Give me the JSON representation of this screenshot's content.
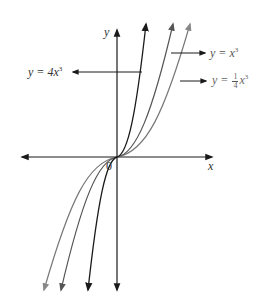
{
  "figure": {
    "axes": {
      "x_label": "x",
      "y_label": "y",
      "origin_label": "0"
    },
    "curves": [
      {
        "id": "y4x3",
        "equation": "y = 4x^3",
        "label_prefix": "y = 4",
        "label_var": "x",
        "label_exp": "3",
        "color": "#1a1a1a"
      },
      {
        "id": "yx3",
        "equation": "y = x^3",
        "label_prefix": "y = ",
        "label_var": "x",
        "label_exp": "3",
        "color": "#444444"
      },
      {
        "id": "yq3",
        "equation": "y = 1/4 x^3",
        "label_prefix": "y = ",
        "frac_num": "1",
        "frac_den": "4",
        "label_var": "x",
        "label_exp": "3",
        "color": "#777777"
      }
    ]
  },
  "colors": {
    "axis": "#1a1a1a",
    "background": "#ffffff"
  }
}
